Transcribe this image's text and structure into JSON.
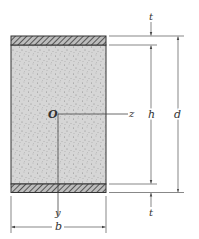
{
  "diagram": {
    "colors": {
      "core_fill": "#d4d4d4",
      "core_dots": "#8a8a8a",
      "face_fill": "#b0b0b0",
      "line": "#333333",
      "dim_line": "#555555"
    },
    "labels": {
      "t_top": "t",
      "t_bottom": "t",
      "h": "h",
      "d": "d",
      "b": "b",
      "origin": "O",
      "z_axis": "z",
      "y_axis": "y"
    },
    "parts": [
      {
        "name": "top-face",
        "description": "hatched face plate, thickness t"
      },
      {
        "name": "core",
        "description": "stippled core, height h"
      },
      {
        "name": "bottom-face",
        "description": "hatched face plate, thickness t"
      }
    ]
  }
}
